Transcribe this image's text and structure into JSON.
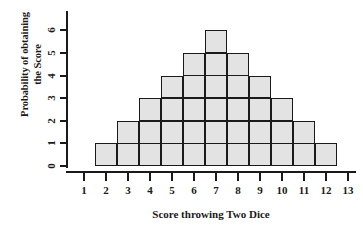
{
  "chart_data": {
    "type": "bar",
    "title": "",
    "subtitle": "",
    "xlabel": "Score throwing Two Dice",
    "ylabel": "Probability of obtaining the Score",
    "ylabel_line1": "Probability of obtaining",
    "ylabel_line2": "the Score",
    "categories": [
      2,
      3,
      4,
      5,
      6,
      7,
      8,
      9,
      10,
      11,
      12
    ],
    "values": [
      1,
      2,
      3,
      4,
      5,
      6,
      5,
      4,
      3,
      2,
      1
    ],
    "x_ticks": [
      1,
      2,
      3,
      4,
      5,
      6,
      7,
      8,
      9,
      10,
      11,
      12,
      13
    ],
    "y_ticks": [
      0,
      1,
      2,
      3,
      4,
      5,
      6
    ],
    "xlim": [
      1,
      13
    ],
    "ylim": [
      0,
      6
    ],
    "grid": false,
    "legend": "none",
    "bar_fill_color": "#e3e3e3",
    "bar_border_color": "#1a1a1a",
    "axis_color": "#1a1a1a",
    "background_color": "#ffffff"
  }
}
